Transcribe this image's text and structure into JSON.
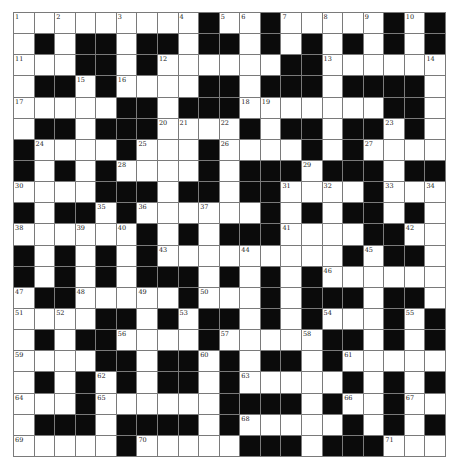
{
  "puzzle": {
    "rows": 21,
    "cols": 21,
    "colors": {
      "block": "#0b0b0b",
      "cell": "#ffffff",
      "gridline": "#7a7a7a",
      "number": "#222222"
    },
    "grid": [
      ".........#..#.....#.#",
      ".#.##.##.##.#.#.#.#.#",
      "...##.#......##......",
      ".##.#....##.###.####.",
      ".....##.###.......##.",
      ".##.###....#.##.##.#.",
      "#....#...#....#.#....",
      "#.#.#....#.###.###.##",
      "....###.##.##....#...",
      "#.##.#......#.#.##.#.",
      "......#.#.###....##..",
      "#.#.#.#.........#.##.",
      "#.#.#.###.#.#.#......",
      ".##.....#...#.###.##.",
      "....##.#.##.#.#...#.#",
      ".#.##....#.....##.#.#",
      "....##.##.#.##.#.....",
      ".#.#.#.##.#.....#.#.#",
      "...#......####.#..#..",
      ".###.####.#.....#.#.#",
      ".....#.....###.###..."
    ],
    "numbers": [
      {
        "r": 0,
        "c": 0,
        "n": "1"
      },
      {
        "r": 0,
        "c": 2,
        "n": "2"
      },
      {
        "r": 0,
        "c": 5,
        "n": "3"
      },
      {
        "r": 0,
        "c": 8,
        "n": "4"
      },
      {
        "r": 0,
        "c": 10,
        "n": "5"
      },
      {
        "r": 0,
        "c": 11,
        "n": "6"
      },
      {
        "r": 0,
        "c": 13,
        "n": "7"
      },
      {
        "r": 0,
        "c": 15,
        "n": "8"
      },
      {
        "r": 0,
        "c": 17,
        "n": "9"
      },
      {
        "r": 0,
        "c": 19,
        "n": "10"
      },
      {
        "r": 2,
        "c": 0,
        "n": "11"
      },
      {
        "r": 2,
        "c": 7,
        "n": "12"
      },
      {
        "r": 2,
        "c": 15,
        "n": "13"
      },
      {
        "r": 2,
        "c": 20,
        "n": "14"
      },
      {
        "r": 3,
        "c": 3,
        "n": "15"
      },
      {
        "r": 3,
        "c": 5,
        "n": "16"
      },
      {
        "r": 4,
        "c": 0,
        "n": "17"
      },
      {
        "r": 4,
        "c": 11,
        "n": "18"
      },
      {
        "r": 4,
        "c": 12,
        "n": "19"
      },
      {
        "r": 5,
        "c": 7,
        "n": "20"
      },
      {
        "r": 5,
        "c": 8,
        "n": "21"
      },
      {
        "r": 5,
        "c": 10,
        "n": "22"
      },
      {
        "r": 5,
        "c": 18,
        "n": "23"
      },
      {
        "r": 6,
        "c": 1,
        "n": "24"
      },
      {
        "r": 6,
        "c": 6,
        "n": "25"
      },
      {
        "r": 6,
        "c": 10,
        "n": "26"
      },
      {
        "r": 6,
        "c": 17,
        "n": "27"
      },
      {
        "r": 7,
        "c": 5,
        "n": "28"
      },
      {
        "r": 7,
        "c": 14,
        "n": "29"
      },
      {
        "r": 8,
        "c": 0,
        "n": "30"
      },
      {
        "r": 8,
        "c": 13,
        "n": "31"
      },
      {
        "r": 8,
        "c": 15,
        "n": "32"
      },
      {
        "r": 8,
        "c": 18,
        "n": "33"
      },
      {
        "r": 8,
        "c": 20,
        "n": "34"
      },
      {
        "r": 9,
        "c": 4,
        "n": "35"
      },
      {
        "r": 9,
        "c": 6,
        "n": "36"
      },
      {
        "r": 9,
        "c": 9,
        "n": "37"
      },
      {
        "r": 10,
        "c": 0,
        "n": "38"
      },
      {
        "r": 10,
        "c": 3,
        "n": "39"
      },
      {
        "r": 10,
        "c": 5,
        "n": "40"
      },
      {
        "r": 10,
        "c": 13,
        "n": "41"
      },
      {
        "r": 10,
        "c": 19,
        "n": "42"
      },
      {
        "r": 11,
        "c": 7,
        "n": "43"
      },
      {
        "r": 11,
        "c": 11,
        "n": "44"
      },
      {
        "r": 11,
        "c": 17,
        "n": "45"
      },
      {
        "r": 12,
        "c": 15,
        "n": "46"
      },
      {
        "r": 13,
        "c": 0,
        "n": "47"
      },
      {
        "r": 13,
        "c": 3,
        "n": "48"
      },
      {
        "r": 13,
        "c": 6,
        "n": "49"
      },
      {
        "r": 13,
        "c": 9,
        "n": "50"
      },
      {
        "r": 14,
        "c": 0,
        "n": "51"
      },
      {
        "r": 14,
        "c": 2,
        "n": "52"
      },
      {
        "r": 14,
        "c": 8,
        "n": "53"
      },
      {
        "r": 14,
        "c": 15,
        "n": "54"
      },
      {
        "r": 14,
        "c": 19,
        "n": "55"
      },
      {
        "r": 15,
        "c": 5,
        "n": "56"
      },
      {
        "r": 15,
        "c": 10,
        "n": "57"
      },
      {
        "r": 15,
        "c": 14,
        "n": "58"
      },
      {
        "r": 16,
        "c": 0,
        "n": "59"
      },
      {
        "r": 16,
        "c": 9,
        "n": "60"
      },
      {
        "r": 16,
        "c": 16,
        "n": "61"
      },
      {
        "r": 17,
        "c": 4,
        "n": "62"
      },
      {
        "r": 17,
        "c": 11,
        "n": "63"
      },
      {
        "r": 18,
        "c": 0,
        "n": "64"
      },
      {
        "r": 18,
        "c": 4,
        "n": "65"
      },
      {
        "r": 18,
        "c": 16,
        "n": "66"
      },
      {
        "r": 18,
        "c": 19,
        "n": "67"
      },
      {
        "r": 19,
        "c": 11,
        "n": "68"
      },
      {
        "r": 20,
        "c": 0,
        "n": "69"
      },
      {
        "r": 20,
        "c": 6,
        "n": "70"
      },
      {
        "r": 20,
        "c": 18,
        "n": "71"
      }
    ]
  }
}
